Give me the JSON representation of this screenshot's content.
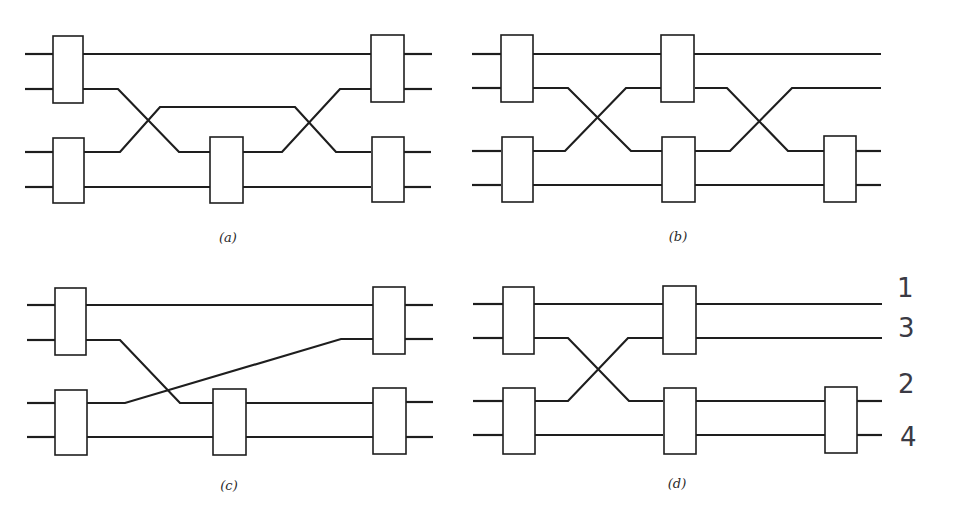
{
  "figure": {
    "background": "#ffffff",
    "ink_color": "#1e1e1e",
    "panels": [
      {
        "id": "a",
        "label": "(a)",
        "label_pos": [
          228,
          242
        ],
        "wires": [
          [
            [
              25,
              54
            ],
            [
              53,
              54
            ]
          ],
          [
            [
              25,
              89
            ],
            [
              53,
              89
            ]
          ],
          [
            [
              25,
              152
            ],
            [
              53,
              152
            ]
          ],
          [
            [
              25,
              187
            ],
            [
              53,
              187
            ]
          ],
          [
            [
              83,
              54
            ],
            [
              371,
              54
            ]
          ],
          [
            [
              83,
              89
            ],
            [
              118,
              89
            ],
            [
              179,
              152
            ],
            [
              210,
              152
            ]
          ],
          [
            [
              84,
              152
            ],
            [
              120,
              152
            ],
            [
              160,
              107
            ],
            [
              295,
              107
            ],
            [
              336,
              152
            ],
            [
              371,
              152
            ]
          ],
          [
            [
              84,
              187
            ],
            [
              210,
              187
            ]
          ],
          [
            [
              243,
              152
            ],
            [
              282,
              152
            ],
            [
              340,
              89
            ],
            [
              371,
              89
            ]
          ],
          [
            [
              243,
              187
            ],
            [
              371,
              187
            ]
          ],
          [
            [
              404,
              54
            ],
            [
              432,
              54
            ]
          ],
          [
            [
              404,
              89
            ],
            [
              432,
              89
            ]
          ],
          [
            [
              404,
              152
            ],
            [
              431,
              152
            ]
          ],
          [
            [
              404,
              187
            ],
            [
              431,
              187
            ]
          ]
        ],
        "gates": [
          {
            "x": 53,
            "y": 36,
            "w": 30,
            "h": 67
          },
          {
            "x": 53,
            "y": 138,
            "w": 31,
            "h": 65
          },
          {
            "x": 210,
            "y": 137,
            "w": 33,
            "h": 66
          },
          {
            "x": 371,
            "y": 35,
            "w": 33,
            "h": 67
          },
          {
            "x": 372,
            "y": 137,
            "w": 32,
            "h": 65
          }
        ]
      },
      {
        "id": "b",
        "label": "(b)",
        "label_pos": [
          678,
          241
        ],
        "wires": [
          [
            [
              472,
              54
            ],
            [
              501,
              54
            ]
          ],
          [
            [
              472,
              88
            ],
            [
              501,
              88
            ]
          ],
          [
            [
              472,
              151
            ],
            [
              501,
              151
            ]
          ],
          [
            [
              472,
              185
            ],
            [
              501,
              185
            ]
          ],
          [
            [
              533,
              54
            ],
            [
              661,
              54
            ]
          ],
          [
            [
              533,
              88
            ],
            [
              568,
              88
            ],
            [
              631,
              151
            ],
            [
              662,
              151
            ]
          ],
          [
            [
              533,
              151
            ],
            [
              565,
              151
            ],
            [
              626,
              88
            ],
            [
              661,
              88
            ]
          ],
          [
            [
              533,
              185
            ],
            [
              662,
              185
            ]
          ],
          [
            [
              694,
              54
            ],
            [
              881,
              54
            ]
          ],
          [
            [
              695,
              88
            ],
            [
              727,
              88
            ],
            [
              788,
              151
            ],
            [
              824,
              151
            ]
          ],
          [
            [
              695,
              151
            ],
            [
              730,
              151
            ],
            [
              792,
              88
            ],
            [
              881,
              88
            ]
          ],
          [
            [
              695,
              185
            ],
            [
              824,
              185
            ]
          ],
          [
            [
              856,
              151
            ],
            [
              881,
              151
            ]
          ],
          [
            [
              856,
              185
            ],
            [
              881,
              185
            ]
          ]
        ],
        "gates": [
          {
            "x": 501,
            "y": 35,
            "w": 32,
            "h": 67
          },
          {
            "x": 502,
            "y": 137,
            "w": 31,
            "h": 65
          },
          {
            "x": 661,
            "y": 35,
            "w": 33,
            "h": 67
          },
          {
            "x": 662,
            "y": 137,
            "w": 33,
            "h": 65
          },
          {
            "x": 824,
            "y": 136,
            "w": 32,
            "h": 66
          }
        ]
      },
      {
        "id": "c",
        "label": "(c)",
        "label_pos": [
          229,
          490
        ],
        "wires": [
          [
            [
              27,
              305
            ],
            [
              55,
              305
            ]
          ],
          [
            [
              27,
              340
            ],
            [
              55,
              340
            ]
          ],
          [
            [
              27,
              403
            ],
            [
              55,
              403
            ]
          ],
          [
            [
              27,
              437
            ],
            [
              55,
              437
            ]
          ],
          [
            [
              86,
              305
            ],
            [
              373,
              305
            ]
          ],
          [
            [
              86,
              340
            ],
            [
              120,
              340
            ],
            [
              180,
              403
            ],
            [
              213,
              403
            ]
          ],
          [
            [
              87,
              403
            ],
            [
              125,
              403
            ],
            [
              341,
              339
            ],
            [
              373,
              339
            ]
          ],
          [
            [
              87,
              437
            ],
            [
              213,
              437
            ]
          ],
          [
            [
              246,
              403
            ],
            [
              373,
              403
            ]
          ],
          [
            [
              246,
              437
            ],
            [
              373,
              437
            ]
          ],
          [
            [
              405,
              305
            ],
            [
              433,
              305
            ]
          ],
          [
            [
              405,
              339
            ],
            [
              433,
              339
            ]
          ],
          [
            [
              405,
              402
            ],
            [
              433,
              402
            ]
          ],
          [
            [
              405,
              437
            ],
            [
              433,
              437
            ]
          ]
        ],
        "gates": [
          {
            "x": 55,
            "y": 288,
            "w": 31,
            "h": 67
          },
          {
            "x": 55,
            "y": 390,
            "w": 32,
            "h": 65
          },
          {
            "x": 213,
            "y": 389,
            "w": 33,
            "h": 66
          },
          {
            "x": 373,
            "y": 287,
            "w": 32,
            "h": 67
          },
          {
            "x": 373,
            "y": 388,
            "w": 33,
            "h": 66
          }
        ]
      },
      {
        "id": "d",
        "label": "(d)",
        "label_pos": [
          677,
          488
        ],
        "wires": [
          [
            [
              473,
              304
            ],
            [
              503,
              304
            ]
          ],
          [
            [
              473,
              338
            ],
            [
              503,
              338
            ]
          ],
          [
            [
              473,
              401
            ],
            [
              503,
              401
            ]
          ],
          [
            [
              473,
              435
            ],
            [
              503,
              435
            ]
          ],
          [
            [
              534,
              304
            ],
            [
              663,
              304
            ]
          ],
          [
            [
              534,
              338
            ],
            [
              568,
              338
            ],
            [
              629,
              401
            ],
            [
              663,
              401
            ]
          ],
          [
            [
              534,
              401
            ],
            [
              568,
              401
            ],
            [
              628,
              338
            ],
            [
              663,
              338
            ]
          ],
          [
            [
              535,
              435
            ],
            [
              663,
              435
            ]
          ],
          [
            [
              696,
              304
            ],
            [
              882,
              304
            ]
          ],
          [
            [
              696,
              338
            ],
            [
              882,
              338
            ]
          ],
          [
            [
              696,
              401
            ],
            [
              825,
              401
            ]
          ],
          [
            [
              696,
              435
            ],
            [
              825,
              435
            ]
          ],
          [
            [
              857,
              401
            ],
            [
              882,
              401
            ]
          ],
          [
            [
              857,
              435
            ],
            [
              882,
              435
            ]
          ]
        ],
        "gates": [
          {
            "x": 503,
            "y": 287,
            "w": 31,
            "h": 67
          },
          {
            "x": 503,
            "y": 388,
            "w": 32,
            "h": 66
          },
          {
            "x": 663,
            "y": 286,
            "w": 33,
            "h": 68
          },
          {
            "x": 664,
            "y": 388,
            "w": 32,
            "h": 66
          },
          {
            "x": 825,
            "y": 387,
            "w": 32,
            "h": 66
          }
        ]
      }
    ],
    "handwritten_labels": [
      {
        "text": "1",
        "x": 897,
        "y": 297
      },
      {
        "text": "3",
        "x": 898,
        "y": 337
      },
      {
        "text": "2",
        "x": 898,
        "y": 393
      },
      {
        "text": "4",
        "x": 900,
        "y": 446
      }
    ]
  }
}
